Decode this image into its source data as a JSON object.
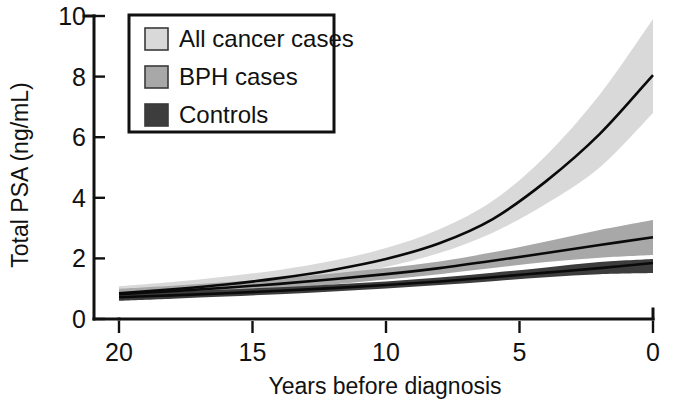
{
  "chart_data": {
    "type": "line",
    "title": "",
    "xlabel": "Years before diagnosis",
    "ylabel": "Total PSA (ng/mL)",
    "xlim": [
      20,
      0
    ],
    "ylim": [
      0,
      10
    ],
    "x_ticks": [
      "20",
      "15",
      "10",
      "5",
      "0"
    ],
    "x_tick_values": [
      20,
      15,
      10,
      5,
      0
    ],
    "y_ticks": [
      "0",
      "2",
      "4",
      "6",
      "8",
      "10"
    ],
    "y_tick_values": [
      0,
      2,
      4,
      6,
      8,
      10
    ],
    "x_direction": "reversed",
    "grid": false,
    "legend_position": "top-left-inside",
    "bands": "95% confidence intervals shown as shaded envelopes",
    "x": [
      20,
      18,
      16,
      14,
      12,
      10,
      8,
      6,
      4,
      2,
      0
    ],
    "series": [
      {
        "name": "All cancer cases",
        "color": "#d9d9d9",
        "line_color": "#0a0a0a",
        "values": [
          0.85,
          0.98,
          1.14,
          1.35,
          1.62,
          1.98,
          2.5,
          3.3,
          4.55,
          6.1,
          8.05
        ],
        "band_lower": [
          0.62,
          0.77,
          0.94,
          1.14,
          1.4,
          1.72,
          2.18,
          2.85,
          3.8,
          5.0,
          6.8
        ],
        "band_upper": [
          1.08,
          1.22,
          1.4,
          1.62,
          1.92,
          2.34,
          2.96,
          3.9,
          5.4,
          7.4,
          9.9
        ]
      },
      {
        "name": "BPH cases",
        "color": "#a8a8a8",
        "line_color": "#0a0a0a",
        "values": [
          0.82,
          0.92,
          1.03,
          1.16,
          1.31,
          1.48,
          1.68,
          1.92,
          2.18,
          2.44,
          2.7
        ],
        "band_lower": [
          0.64,
          0.75,
          0.87,
          1.0,
          1.14,
          1.3,
          1.48,
          1.68,
          1.88,
          2.02,
          2.11
        ],
        "band_upper": [
          1.0,
          1.1,
          1.21,
          1.34,
          1.5,
          1.68,
          1.9,
          2.2,
          2.56,
          2.94,
          3.27
        ]
      },
      {
        "name": "Controls",
        "color": "#3d3d3d",
        "line_color": "#0a0a0a",
        "values": [
          0.72,
          0.78,
          0.85,
          0.93,
          1.02,
          1.12,
          1.24,
          1.38,
          1.53,
          1.68,
          1.85
        ],
        "band_lower": [
          0.6,
          0.67,
          0.74,
          0.82,
          0.91,
          1.01,
          1.12,
          1.25,
          1.38,
          1.48,
          1.52
        ],
        "band_upper": [
          0.84,
          0.9,
          0.97,
          1.05,
          1.14,
          1.24,
          1.37,
          1.53,
          1.7,
          1.88,
          1.98
        ]
      }
    ]
  },
  "legend": {
    "items": [
      {
        "label": "All cancer cases",
        "swatch": "#d9d9d9"
      },
      {
        "label": "BPH cases",
        "swatch": "#a8a8a8"
      },
      {
        "label": "Controls",
        "swatch": "#3d3d3d"
      }
    ]
  },
  "axes": {
    "y_title": "Total PSA (ng/mL)",
    "x_title": "Years before diagnosis",
    "y_labels": [
      "10",
      "8",
      "6",
      "4",
      "2",
      "0"
    ],
    "x_labels": [
      "20",
      "15",
      "10",
      "5",
      "0"
    ]
  }
}
